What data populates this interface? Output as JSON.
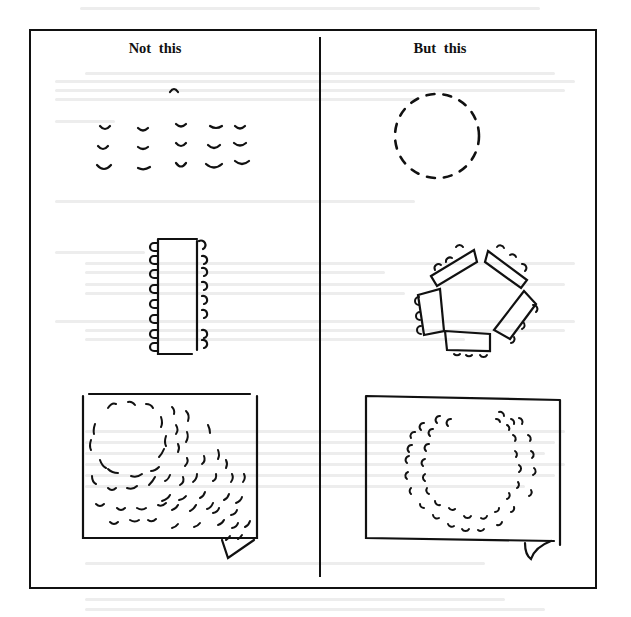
{
  "diagram": {
    "type": "seating-arrangement-comparison",
    "columns": [
      {
        "title": "Not this",
        "panels": [
          {
            "description": "Rows of chairs facing a single leader",
            "rows": 3,
            "chairs_per_row": 5
          },
          {
            "description": "Long rectangular table with chairs along both sides",
            "chairs_left": 7,
            "chairs_right": 7
          },
          {
            "description": "Room with chairs in a circle and scattered rows crowding a corner"
          }
        ]
      },
      {
        "title": "But this",
        "panels": [
          {
            "description": "Chairs arranged in a single circle"
          },
          {
            "description": "Five tables arranged in a pentagon with chairs on outer sides",
            "tables": 5
          },
          {
            "description": "Room with chairs in a double-ring circle centered in the room"
          }
        ]
      }
    ],
    "colors": {
      "ink": "#111111",
      "background": "#ffffff",
      "bleed_through": "#ededed"
    }
  }
}
